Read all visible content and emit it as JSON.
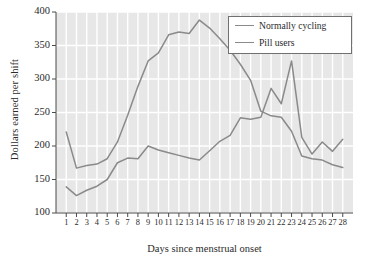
{
  "chart_data": {
    "type": "line",
    "title": "",
    "xlabel": "Days since menstrual onset",
    "ylabel": "Dollars earned per shift",
    "xlim": [
      0,
      29
    ],
    "ylim": [
      100,
      400
    ],
    "yticks": [
      100,
      150,
      200,
      250,
      300,
      350,
      400
    ],
    "xticks": [
      1,
      2,
      3,
      4,
      5,
      6,
      7,
      8,
      9,
      10,
      11,
      12,
      13,
      14,
      15,
      16,
      17,
      18,
      19,
      20,
      21,
      22,
      23,
      24,
      25,
      26,
      27,
      28
    ],
    "grid": true,
    "legend_position": "top-right",
    "x": [
      1,
      2,
      3,
      4,
      5,
      6,
      7,
      8,
      9,
      10,
      11,
      12,
      13,
      14,
      15,
      16,
      17,
      18,
      19,
      20,
      21,
      22,
      23,
      24,
      25,
      26,
      27,
      28
    ],
    "series": [
      {
        "name": "Normally cycling",
        "color": "#8a8a8a",
        "values": [
          221,
          167,
          171,
          173,
          181,
          206,
          246,
          289,
          327,
          339,
          366,
          370,
          368,
          388,
          376,
          360,
          343,
          322,
          298,
          252,
          245,
          243,
          222,
          185,
          181,
          179,
          172,
          168
        ]
      },
      {
        "name": "Pill users",
        "color": "#8a8a8a",
        "values": [
          139,
          126,
          134,
          140,
          150,
          175,
          182,
          181,
          200,
          194,
          190,
          186,
          182,
          179,
          193,
          207,
          216,
          242,
          240,
          243,
          286,
          263,
          327,
          213,
          188,
          206,
          192,
          210
        ]
      }
    ],
    "legend": [
      {
        "label": "Normally cycling"
      },
      {
        "label": "Pill users"
      }
    ],
    "colors": {
      "plot_background": "#e7e7e7",
      "gridline": "#ffffff",
      "axis": "#4a4a4a",
      "line": "#8a8a8a",
      "text": "#2b2b2b",
      "legend_border": "#707070"
    }
  }
}
